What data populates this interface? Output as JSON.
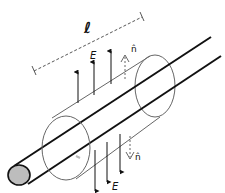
{
  "diagram": {
    "labels": {
      "length": "ℓ",
      "field_top": "E",
      "field_bottom": "E",
      "normal_top": "n̂",
      "normal_bottom": "n̂"
    },
    "colors": {
      "line": "#111111",
      "cylinder": "#666666",
      "rod_end_fill": "#bdbdbd",
      "background": "#ffffff"
    },
    "elements": [
      "charged-rod",
      "gaussian-cylinder",
      "length-dimension",
      "upward-field-arrows",
      "downward-field-arrows",
      "normal-vector-top",
      "normal-vector-bottom"
    ]
  }
}
